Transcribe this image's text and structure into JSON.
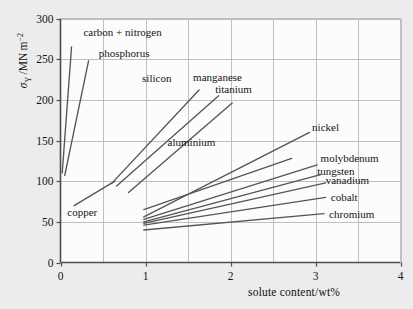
{
  "chart_data": {
    "type": "line",
    "title": "",
    "xlabel": "solute content/wt%",
    "ylabel": "σY / MN m⁻²",
    "ylabel_parts": {
      "symbol": "σ",
      "subscript": "Y",
      "rest": "/MN m",
      "exponent": "−2"
    },
    "xlim": [
      0,
      4
    ],
    "ylim": [
      0,
      300
    ],
    "xticks": [
      0,
      1,
      2,
      3,
      4
    ],
    "xticklabels": [
      "0",
      "1",
      "2",
      "3",
      "4"
    ],
    "yticks": [
      0,
      50,
      100,
      150,
      200,
      250,
      300
    ],
    "yticklabels": [
      "0",
      "50",
      "100",
      "150",
      "200",
      "250",
      "300"
    ],
    "grid": true,
    "grid_x_minor_step": 0.5,
    "legend": "inline-labels",
    "legend_position": "inline",
    "line_color": "#555555",
    "grid_color": "#bfbfbf",
    "axis_color": "#4d4d4d",
    "plot_bg": "#fcfcfc",
    "page_bg": "#ececec",
    "series": [
      {
        "name": "carbon + nitrogen",
        "label": "carbon + nitrogen",
        "x": [
          0.02,
          0.13
        ],
        "y": [
          110,
          265
        ],
        "label_x": 0.27,
        "label_y": 283,
        "anchor": "start"
      },
      {
        "name": "phosphorus",
        "label": "phosphorus",
        "x": [
          0.05,
          0.33
        ],
        "y": [
          107,
          248
        ],
        "label_x": 0.45,
        "label_y": 258,
        "anchor": "start"
      },
      {
        "name": "copper",
        "label": "copper",
        "x": [
          0.16,
          0.64
        ],
        "y": [
          70,
          100
        ],
        "label_x": 0.08,
        "label_y": 62,
        "anchor": "start"
      },
      {
        "name": "silicon",
        "label": "silicon",
        "x": [
          0.6,
          1.63
        ],
        "y": [
          97,
          212
        ],
        "label_x": 0.96,
        "label_y": 227,
        "anchor": "start"
      },
      {
        "name": "manganese",
        "label": "manganese",
        "x": [
          0.66,
          1.86
        ],
        "y": [
          94,
          205
        ],
        "label_x": 1.56,
        "label_y": 228,
        "anchor": "start"
      },
      {
        "name": "titanium",
        "label": "titanium",
        "x": [
          0.8,
          2.02
        ],
        "y": [
          86,
          196
        ],
        "label_x": 1.82,
        "label_y": 213,
        "anchor": "start"
      },
      {
        "name": "aluminium",
        "label": "aluminium",
        "x": [
          0.98,
          2.72
        ],
        "y": [
          65,
          128
        ],
        "label_x": 1.26,
        "label_y": 148,
        "anchor": "start"
      },
      {
        "name": "nickel",
        "label": "nickel",
        "x": [
          0.98,
          2.93
        ],
        "y": [
          56,
          160
        ],
        "label_x": 2.96,
        "label_y": 166,
        "anchor": "start"
      },
      {
        "name": "molybdenum",
        "label": "molybdenum",
        "x": [
          0.98,
          3.02
        ],
        "y": [
          53,
          120
        ],
        "label_x": 3.06,
        "label_y": 128,
        "anchor": "start"
      },
      {
        "name": "tungsten",
        "label": "tungsten",
        "x": [
          0.98,
          3.06
        ],
        "y": [
          50,
          108
        ],
        "label_x": 3.02,
        "label_y": 113,
        "anchor": "start"
      },
      {
        "name": "vanadium",
        "label": "vanadium",
        "x": [
          0.98,
          3.12
        ],
        "y": [
          48,
          98
        ],
        "label_x": 3.12,
        "label_y": 101,
        "anchor": "start"
      },
      {
        "name": "cobalt",
        "label": "cobalt",
        "x": [
          0.98,
          3.12
        ],
        "y": [
          46,
          80
        ],
        "label_x": 3.18,
        "label_y": 80,
        "anchor": "start"
      },
      {
        "name": "chromium",
        "label": "chromium",
        "x": [
          0.98,
          3.1
        ],
        "y": [
          40,
          60
        ],
        "label_x": 3.16,
        "label_y": 60,
        "anchor": "start"
      }
    ]
  }
}
